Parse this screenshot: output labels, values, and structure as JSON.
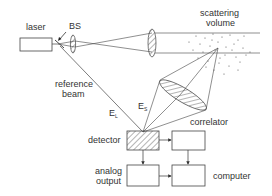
{
  "diagram": {
    "type": "optical-setup",
    "labels": {
      "laser": "laser",
      "beam_splitter": "BS",
      "scattering_volume_line1": "scattering",
      "scattering_volume_line2": "volume",
      "reference_beam_line1": "reference",
      "reference_beam_line2": "beam",
      "field_local": "E",
      "field_local_sub": "L",
      "field_scattered": "E",
      "field_scattered_sub": "S",
      "detector": "detector",
      "correlator": "correlator",
      "analog_output_line1": "analog",
      "analog_output_line2": "output",
      "computer": "computer"
    },
    "nodes": [
      "laser",
      "BS",
      "lens",
      "scattering volume",
      "collection lens",
      "detector",
      "correlator",
      "analog output",
      "computer"
    ],
    "edges": [
      [
        "laser",
        "BS"
      ],
      [
        "BS",
        "lens"
      ],
      [
        "lens",
        "scattering volume"
      ],
      [
        "BS",
        "detector"
      ],
      [
        "scattering volume",
        "collection lens"
      ],
      [
        "collection lens",
        "detector"
      ],
      [
        "detector",
        "correlator"
      ],
      [
        "detector",
        "analog output"
      ],
      [
        "correlator",
        "computer"
      ],
      [
        "analog output",
        "computer"
      ]
    ],
    "colors": {
      "stroke": "#444444",
      "text": "#333333",
      "background": "#ffffff"
    }
  }
}
